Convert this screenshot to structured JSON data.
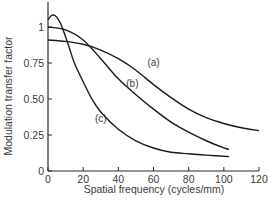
{
  "chart_data": {
    "type": "line",
    "title": "",
    "xlabel": "Spatial frequency (cycles/mm)",
    "ylabel": "Modulation transfer factor",
    "xlim": [
      0,
      120
    ],
    "ylim": [
      0,
      1.1
    ],
    "xticks": [
      0,
      20,
      40,
      60,
      80,
      100,
      120
    ],
    "xtick_labels": [
      "0",
      "20",
      "40",
      "60",
      "80",
      "100",
      "120"
    ],
    "yticks": [
      0,
      0.25,
      0.5,
      0.75,
      1
    ],
    "ytick_labels": [
      "0",
      "0.25",
      "0.50",
      "0.75",
      "1"
    ],
    "grid": false,
    "legend": "none (curves labelled inline)",
    "series": [
      {
        "name": "(a)",
        "label_pos": [
          60,
          0.73
        ],
        "x": [
          0,
          10,
          20,
          30,
          40,
          50,
          60,
          70,
          80,
          90,
          100,
          110,
          120
        ],
        "y": [
          0.91,
          0.9,
          0.88,
          0.84,
          0.78,
          0.7,
          0.6,
          0.51,
          0.43,
          0.37,
          0.33,
          0.3,
          0.28
        ]
      },
      {
        "name": "(b)",
        "label_pos": [
          48,
          0.58
        ],
        "x": [
          0,
          10,
          20,
          30,
          40,
          50,
          60,
          70,
          80,
          90,
          100,
          103
        ],
        "y": [
          1.0,
          0.98,
          0.91,
          0.78,
          0.64,
          0.53,
          0.43,
          0.34,
          0.27,
          0.21,
          0.16,
          0.15
        ]
      },
      {
        "name": "(c)",
        "label_pos": [
          30,
          0.34
        ],
        "x": [
          0,
          2,
          4,
          6,
          8,
          12,
          15,
          20,
          25,
          30,
          40,
          50,
          60,
          70,
          80,
          90,
          103
        ],
        "y": [
          1.05,
          1.08,
          1.08,
          1.05,
          1.0,
          0.86,
          0.75,
          0.62,
          0.5,
          0.41,
          0.29,
          0.21,
          0.16,
          0.13,
          0.12,
          0.11,
          0.1
        ]
      }
    ]
  },
  "style": {
    "line_color": "#1a1a1a",
    "axis_color": "#2a2a2a",
    "text_color": "#3a3a3a",
    "background": "#ffffff"
  }
}
